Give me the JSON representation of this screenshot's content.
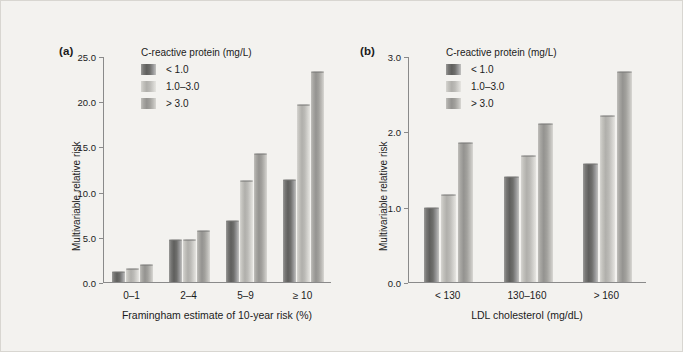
{
  "figure": {
    "background": "#f3f2ef",
    "series_colors": [
      "#5f5f5d",
      "#b0afab",
      "#949390"
    ]
  },
  "panels": [
    {
      "tag": "(a)",
      "legend_title": "C-reactive protein (mg/L)",
      "legend_items": [
        "< 1.0",
        "1.0–3.0",
        "> 3.0"
      ],
      "ylabel": "Multivariable relative risk",
      "xlabel": "Framingham estimate of 10-year risk (%)",
      "yticks": [
        "0.0",
        "5.0",
        "10.0",
        "15.0",
        "20.0",
        "25.0"
      ],
      "categories": [
        "0–1",
        "2–4",
        "5–9",
        "≥ 10"
      ]
    },
    {
      "tag": "(b)",
      "legend_title": "C-reactive protein (mg/L)",
      "legend_items": [
        "< 1.0",
        "1.0–3.0",
        "> 3.0"
      ],
      "ylabel": "Multivariable relative risk",
      "xlabel": "LDL cholesterol (mg/dL)",
      "yticks": [
        "0.0",
        "1.0",
        "2.0",
        "3.0"
      ],
      "categories": [
        "< 130",
        "130–160",
        "> 160"
      ]
    }
  ],
  "chart_data": [
    {
      "type": "bar",
      "panel": "(a)",
      "title": "",
      "xlabel": "Framingham estimate of 10-year risk (%)",
      "ylabel": "Multivariable relative risk",
      "categories": [
        "0–1",
        "2–4",
        "5–9",
        "≥ 10"
      ],
      "series": [
        {
          "name": "< 1.0",
          "values": [
            1.1,
            4.7,
            6.8,
            11.3
          ]
        },
        {
          "name": "1.0–3.0",
          "values": [
            1.4,
            4.7,
            11.2,
            19.6
          ]
        },
        {
          "name": "> 3.0",
          "values": [
            1.9,
            5.6,
            14.2,
            23.2
          ]
        }
      ],
      "ylim": [
        0,
        25
      ],
      "yticks": [
        0.0,
        5.0,
        10.0,
        15.0,
        20.0,
        25.0
      ],
      "grid": false,
      "legend_position": "top-left",
      "legend_title": "C-reactive protein (mg/L)"
    },
    {
      "type": "bar",
      "panel": "(b)",
      "title": "",
      "xlabel": "LDL cholesterol (mg/dL)",
      "ylabel": "Multivariable relative risk",
      "categories": [
        "< 130",
        "130–160",
        "> 160"
      ],
      "series": [
        {
          "name": "< 1.0",
          "values": [
            0.98,
            1.4,
            1.56
          ]
        },
        {
          "name": "1.0–3.0",
          "values": [
            1.16,
            1.67,
            2.21
          ]
        },
        {
          "name": "> 3.0",
          "values": [
            1.85,
            2.1,
            2.79
          ]
        }
      ],
      "ylim": [
        0,
        3
      ],
      "yticks": [
        0.0,
        1.0,
        2.0,
        3.0
      ],
      "grid": false,
      "legend_position": "top-left",
      "legend_title": "C-reactive protein (mg/L)"
    }
  ]
}
